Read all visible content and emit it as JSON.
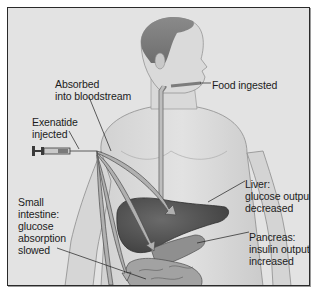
{
  "diagram": {
    "background_color": "#e3e3e3",
    "border_color": "#2a2a2a",
    "labels": {
      "absorbed": "Absorbed\ninto bloodstream",
      "food": "Food ingested",
      "exenatide": "Exenatide\ninjected",
      "liver": "Liver:\nglucose output\ndecreased",
      "pancreas": "Pancreas:\ninsulin output\nincreased",
      "intestine": "Small\nintestine:\nglucose\nabsorption\nslowed"
    },
    "icons": {
      "syringe": "syringe-icon",
      "figure": "human-torso-illustration"
    }
  }
}
